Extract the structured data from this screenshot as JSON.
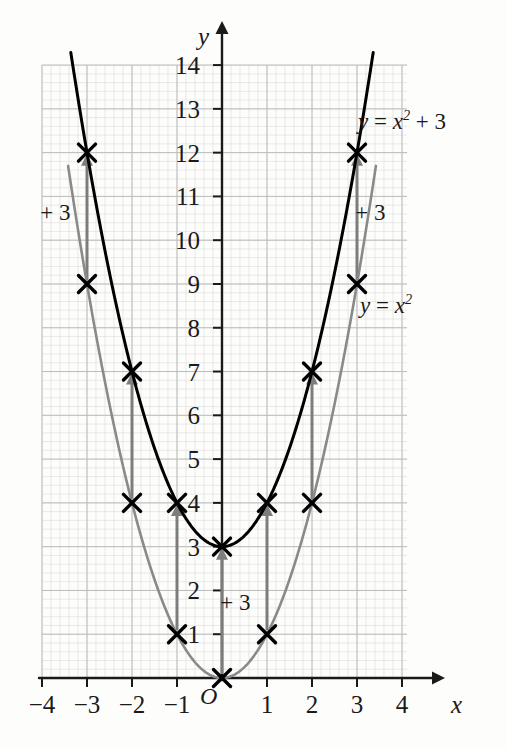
{
  "chart_data": {
    "type": "line",
    "title": "",
    "xlabel": "x",
    "ylabel": "y",
    "xlim": [
      -4.5,
      4.8
    ],
    "ylim": [
      0,
      14.6
    ],
    "grid": true,
    "grid_major_step": 1,
    "grid_minor_per_major": 5,
    "legend": "inline-curve-labels",
    "x_ticks": [
      "-4",
      "-3",
      "-2",
      "-1",
      "1",
      "2",
      "3",
      "4"
    ],
    "x_tick_values": [
      -4,
      -3,
      -2,
      -1,
      1,
      2,
      3,
      4
    ],
    "y_ticks": [
      "1",
      "2",
      "3",
      "4",
      "5",
      "6",
      "7",
      "8",
      "9",
      "10",
      "11",
      "12",
      "13",
      "14"
    ],
    "y_tick_values": [
      1,
      2,
      3,
      4,
      5,
      6,
      7,
      8,
      9,
      10,
      11,
      12,
      13,
      14
    ],
    "origin_label": "O",
    "series": [
      {
        "name": "y = x^2",
        "label": "y = x²",
        "color": "#8a8a8a",
        "equation_parts": {
          "lhs": "y",
          "eq": "=",
          "base": "x",
          "exp": "2"
        },
        "x": [
          -3,
          -2,
          -1,
          0,
          1,
          2,
          3
        ],
        "values": [
          9,
          4,
          1,
          0,
          1,
          4,
          9
        ],
        "markers": "x-cross"
      },
      {
        "name": "y = x^2 + 3",
        "label": "y = x² + 3",
        "color": "#000000",
        "equation_parts": {
          "lhs": "y",
          "eq": "=",
          "base": "x",
          "exp": "2",
          "op": "+",
          "const": "3"
        },
        "x": [
          -3,
          -2,
          -1,
          0,
          1,
          2,
          3
        ],
        "values": [
          12,
          7,
          4,
          3,
          4,
          7,
          12
        ],
        "markers": "x-cross"
      }
    ],
    "annotations": [
      {
        "id": "shift-left",
        "text": "+ 3",
        "x": -3.55,
        "y": 10.6
      },
      {
        "id": "shift-right",
        "text": "+ 3",
        "x": 3.45,
        "y": 10.6
      },
      {
        "id": "shift-center",
        "text": "+ 3",
        "x": 0.45,
        "y": 1.7
      }
    ],
    "translation_arrows": [
      {
        "x": -3,
        "from": 9,
        "to": 12
      },
      {
        "x": -2,
        "from": 4,
        "to": 7
      },
      {
        "x": -1,
        "from": 1,
        "to": 4
      },
      {
        "x": 0,
        "from": 0,
        "to": 3
      },
      {
        "x": 1,
        "from": 1,
        "to": 4
      },
      {
        "x": 2,
        "from": 4,
        "to": 7
      },
      {
        "x": 3,
        "from": 9,
        "to": 12
      }
    ]
  },
  "axes": {
    "y_axis_name": "y",
    "x_axis_name": "x"
  },
  "colors": {
    "curve_shifted": "#000000",
    "curve_base": "#8a8a8a",
    "arrow": "#7d7d7d",
    "grid_minor": "#dcdcdc",
    "grid_major": "#bcbcbc",
    "axis": "#1a1a1a",
    "background": "#fdfdfb"
  }
}
